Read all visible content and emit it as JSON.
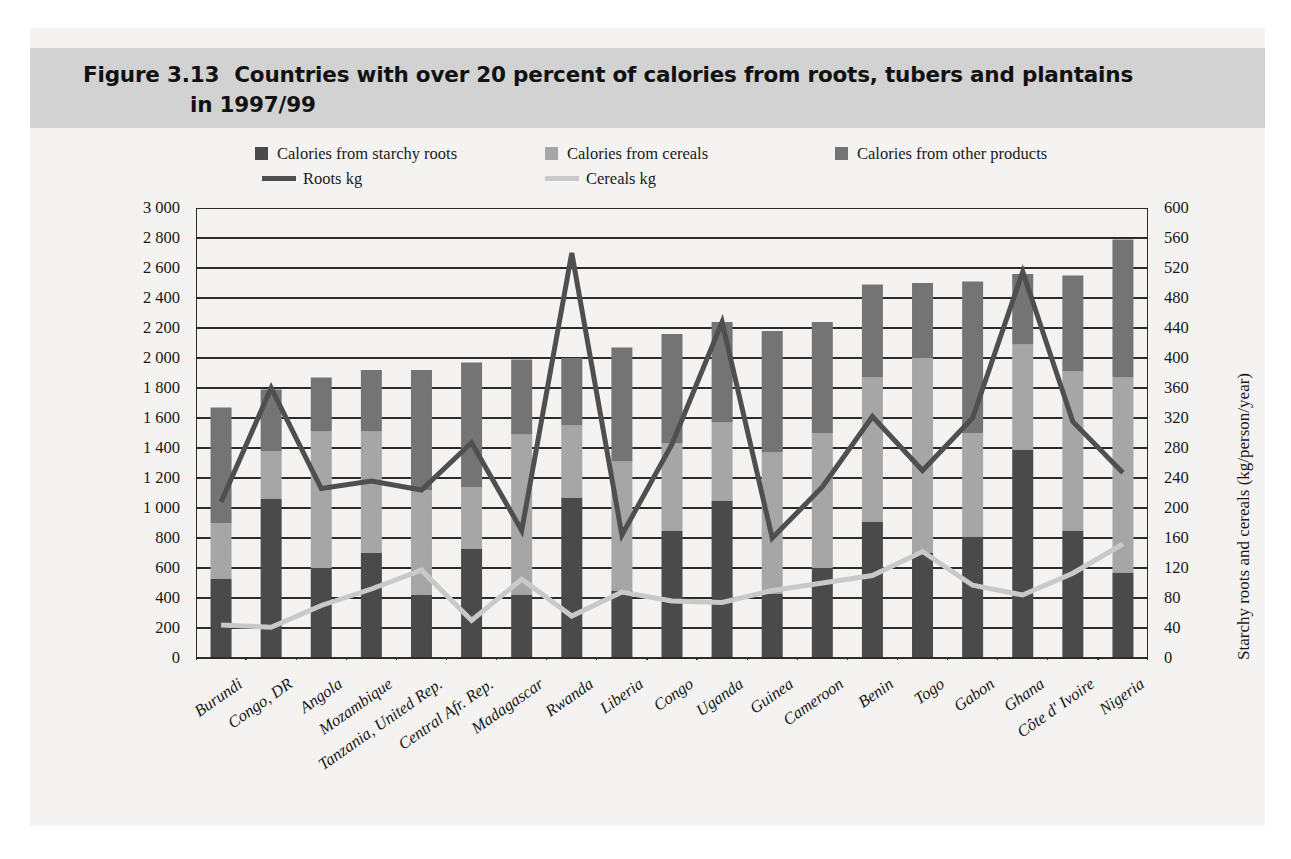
{
  "figure": {
    "number": "Figure 3.13",
    "title_line1": "Countries with over 20 percent of calories from roots, tubers and plantains",
    "title_line2": "in 1997/99"
  },
  "legend": {
    "items": [
      {
        "label": "Calories from starchy roots",
        "color": "#4a4a4a",
        "kind": "swatch",
        "name": "legend-starchy-roots"
      },
      {
        "label": "Calories from cereals",
        "color": "#a6a6a6",
        "kind": "swatch",
        "name": "legend-cereals"
      },
      {
        "label": "Calories from other products",
        "color": "#747474",
        "kind": "swatch",
        "name": "legend-other-products"
      },
      {
        "label": "Roots kg",
        "color": "#4f4f4f",
        "kind": "line",
        "name": "legend-roots-kg"
      },
      {
        "label": "Cereals kg",
        "color": "#c9c9c9",
        "kind": "line",
        "name": "legend-cereals-kg"
      }
    ]
  },
  "colors": {
    "starchy_roots": "#4a4a4a",
    "cereals": "#a6a6a6",
    "other_products": "#747474",
    "roots_line": "#4f4f4f",
    "cereals_line": "#c9c9c9",
    "gridline": "#2b2b2b",
    "title_band": "#d2d2d2",
    "panel_bg": "#f4f3f1"
  },
  "chart_data": {
    "type": "bar",
    "title": "Countries with over 20 percent of calories from roots, tubers and plantains in 1997/99",
    "xlabel": "",
    "ylabel": "Calories/person/day",
    "y2label": "Starchy roots and cereals (kg/person/year)",
    "ylim": [
      0,
      3000
    ],
    "y2lim": [
      0,
      600
    ],
    "yticks": [
      "0",
      "200",
      "400",
      "600",
      "800",
      "1 000",
      "1 200",
      "1 400",
      "1 600",
      "1 800",
      "2 000",
      "2 200",
      "2 400",
      "2 600",
      "2 800",
      "3 000"
    ],
    "y2ticks": [
      "0",
      "40",
      "80",
      "120",
      "160",
      "200",
      "240",
      "280",
      "320",
      "360",
      "400",
      "440",
      "480",
      "520",
      "560",
      "600"
    ],
    "grid": true,
    "legend_position": "top",
    "stacked": true,
    "categories": [
      "Burundi",
      "Congo, DR",
      "Angola",
      "Mozambique",
      "Tanzania, United Rep.",
      "Central Afr. Rep.",
      "Madagascar",
      "Rwanda",
      "Liberia",
      "Congo",
      "Uganda",
      "Guinea",
      "Cameroon",
      "Benin",
      "Togo",
      "Gabon",
      "Ghana",
      "Côte d' Ivoire",
      "Nigeria"
    ],
    "series": [
      {
        "name": "Calories from starchy roots",
        "axis": "left",
        "unit": "Calories/person/day",
        "values": [
          530,
          1060,
          600,
          700,
          420,
          730,
          420,
          1070,
          450,
          850,
          1050,
          430,
          600,
          910,
          700,
          810,
          1390,
          850,
          570
        ]
      },
      {
        "name": "Calories from cereals",
        "axis": "left",
        "unit": "Calories/person/day",
        "values": [
          370,
          320,
          910,
          810,
          700,
          410,
          1070,
          480,
          860,
          580,
          520,
          940,
          900,
          960,
          1300,
          690,
          700,
          1060,
          1300
        ]
      },
      {
        "name": "Calories from other products",
        "axis": "left",
        "unit": "Calories/person/day",
        "values": [
          770,
          410,
          360,
          410,
          800,
          830,
          500,
          450,
          760,
          730,
          670,
          810,
          740,
          620,
          500,
          1010,
          470,
          640,
          920
        ]
      },
      {
        "name": "Roots kg",
        "axis": "right",
        "unit": "kg/person/year",
        "type": "line",
        "values": [
          208,
          360,
          226,
          236,
          224,
          287,
          170,
          540,
          164,
          285,
          448,
          160,
          228,
          322,
          250,
          320,
          515,
          315,
          247
        ]
      },
      {
        "name": "Cereals kg",
        "axis": "right",
        "unit": "kg/person/year",
        "type": "line",
        "values": [
          44,
          41,
          70,
          92,
          117,
          50,
          105,
          56,
          88,
          76,
          74,
          90,
          100,
          110,
          142,
          97,
          84,
          113,
          152
        ]
      }
    ],
    "totals": [
      1670,
      1790,
      1870,
      1920,
      1920,
      1970,
      1990,
      2000,
      2070,
      2160,
      2240,
      2180,
      2240,
      2490,
      2500,
      2510,
      2560,
      2550,
      2790
    ]
  }
}
